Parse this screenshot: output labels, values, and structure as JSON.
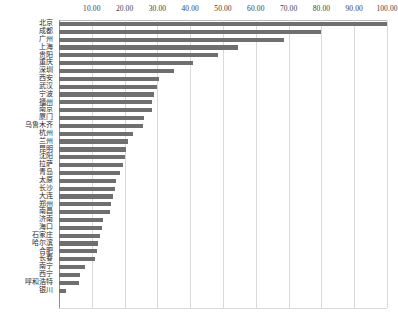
{
  "chart_data": {
    "type": "bar",
    "orientation": "horizontal",
    "title": "",
    "xlabel": "",
    "ylabel": "",
    "xlim": [
      0,
      100
    ],
    "grid": true,
    "legend": null,
    "tick_format": "0.00",
    "xticks": [
      {
        "value": 10,
        "label": "10.00"
      },
      {
        "value": 20,
        "label": "20.00"
      },
      {
        "value": 30,
        "label": "30.00"
      },
      {
        "value": 40,
        "label": "40.00"
      },
      {
        "value": 50,
        "label": "50.00"
      },
      {
        "value": 60,
        "label": "60.00"
      },
      {
        "value": 70,
        "label": "70.00"
      },
      {
        "value": 80,
        "label": "80.00"
      },
      {
        "value": 90,
        "label": "90.00"
      },
      {
        "value": 100,
        "label": "100.00"
      }
    ],
    "categories": [
      "北京",
      "成都",
      "广州",
      "上海",
      "贵阳",
      "重庆",
      "深圳",
      "西安",
      "武汉",
      "宁波",
      "福州",
      "南京",
      "厦门",
      "乌鲁木齐",
      "杭州",
      "兰州",
      "昆明",
      "沈阳",
      "拉萨",
      "青岛",
      "太原",
      "长沙",
      "大连",
      "郑州",
      "南昌",
      "济南",
      "海口",
      "石家庄",
      "哈尔滨",
      "合肥",
      "长春",
      "南宁",
      "西宁",
      "呼和浩特",
      "银川"
    ],
    "values": [
      100.0,
      80.0,
      68.5,
      54.5,
      48.5,
      41.0,
      35.0,
      30.5,
      30.0,
      29.0,
      28.5,
      28.5,
      26.0,
      25.5,
      22.5,
      21.0,
      20.5,
      20.0,
      19.5,
      18.5,
      17.5,
      17.0,
      16.5,
      16.0,
      15.5,
      13.5,
      13.0,
      12.5,
      12.0,
      11.5,
      11.0,
      8.0,
      6.5,
      6.0,
      2.0
    ],
    "bar_color": "#6f6f6f",
    "grid_color": "#d9d9d9",
    "axis_color": "#8f8f8f",
    "text_color": "#2b2b2b"
  }
}
